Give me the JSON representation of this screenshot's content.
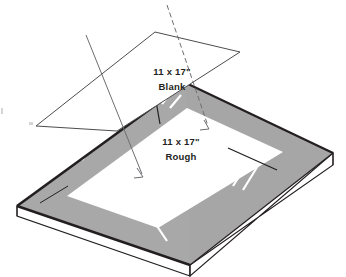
{
  "diagram": {
    "type": "technical-illustration",
    "background_color": "#ffffff",
    "colors": {
      "gray_frame": "#a8a8a8",
      "gray_frame_shade": "#9e9e9e",
      "slab_side": "#ffffff",
      "outline": "#231f20",
      "thin_outline": "#4d4d4d",
      "leader_line": "#6e6e72",
      "white_streak": "#ffffff",
      "inner_sheet": "#ffffff"
    },
    "labels": [
      {
        "id": "blank-label",
        "line1": "11 x 17\"",
        "line2": "Blank",
        "x": 172,
        "y": 75
      },
      {
        "id": "rough-label",
        "line1": "11 x 17\"",
        "line2": "Rough",
        "x": 181,
        "y": 145
      }
    ],
    "leaders": [
      {
        "id": "blank-leader",
        "from_label": "blank-label",
        "points_to": "rough-surface-left",
        "start_x": 86,
        "start_y": 35,
        "end_x": 143,
        "end_y": 176
      },
      {
        "id": "rough-leader",
        "from_label": "rough-label",
        "points_to": "rough-surface-top",
        "start_x": 167,
        "start_y": 5,
        "end_x": 209,
        "end_y": 128
      }
    ],
    "parts": [
      {
        "id": "blank-sheet",
        "name": "11 x 17\" Blank sheet",
        "fill": "#ffffff"
      },
      {
        "id": "slab-top-frame",
        "name": "Rough stock border",
        "fill": "#a8a8a8"
      },
      {
        "id": "rough-area",
        "name": "11 x 17\" Rough area",
        "fill": "#ffffff"
      },
      {
        "id": "slab-front-face",
        "name": "Stack front face",
        "fill": "#ffffff"
      },
      {
        "id": "slab-left-face",
        "name": "Stack left face",
        "fill": "#ffffff"
      }
    ]
  }
}
